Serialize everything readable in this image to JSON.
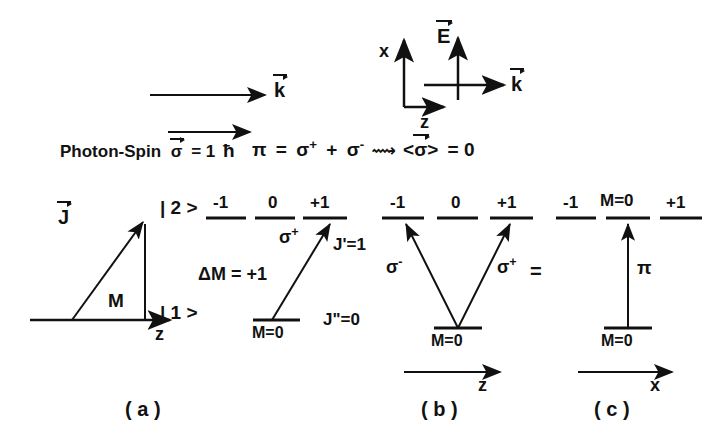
{
  "figure": {
    "title_absent": true,
    "top": {
      "k_vector_label": "k",
      "photon_spin_label": "Photon-Spin",
      "photon_spin_symbol": "σ",
      "photon_spin_value": "= 1",
      "hbar": "ħ",
      "axes": {
        "x_label": "x",
        "z_label": "z",
        "E_label": "E",
        "k_label": "k"
      },
      "pi_equation": {
        "pi": "π",
        "eq1": "=",
        "sigma_plus": "σ",
        "sigma_plus_sup": "+",
        "plus": "+",
        "sigma_minus": "σ",
        "sigma_minus_sup": "-",
        "arrow_glyph": "⟿",
        "bracket_open": "<",
        "sigma_avg": "σ",
        "bracket_close": ">",
        "eq2": "= 0"
      }
    },
    "panel_a": {
      "caption": "( a )",
      "vector_label": "J",
      "projection_label": "M",
      "axis_label": "z",
      "upper_state_ket": "| 2 >",
      "lower_state_ket": "| 1 >",
      "upper_sublevels": [
        "-1",
        "0",
        "+1"
      ],
      "lower_sublevel": "M=0",
      "transition_label": "σ",
      "transition_sup": "+",
      "delta_m": "ΔM = +1",
      "J_upper": "J'=1",
      "J_lower": "J\"=0"
    },
    "panel_b": {
      "caption": "( b )",
      "upper_sublevels": [
        "-1",
        "0",
        "+1"
      ],
      "lower_sublevel": "M=0",
      "left_transition": "σ",
      "left_transition_sup": "-",
      "right_transition": "σ",
      "right_transition_sup": "+",
      "axis_label": "z"
    },
    "panel_c": {
      "caption": "( c )",
      "equals_sign": "=",
      "upper_sublevels": [
        "-1",
        "M=0",
        "+1"
      ],
      "lower_sublevel": "M=0",
      "transition_label": "π",
      "axis_label": "x"
    },
    "colors": {
      "ink": "#111111",
      "background": "#ffffff"
    }
  }
}
